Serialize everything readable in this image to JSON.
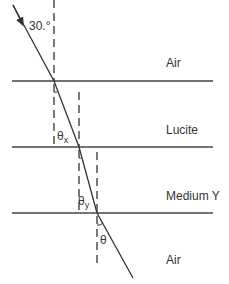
{
  "diagram": {
    "type": "refraction-layers",
    "incident_angle_label": "30.°",
    "layers": [
      {
        "name": "Air"
      },
      {
        "name": "Lucite"
      },
      {
        "name": "Medium Y"
      },
      {
        "name": "Air"
      }
    ],
    "angles": {
      "theta_x": {
        "symbol": "θ",
        "subscript": "x"
      },
      "theta_y": {
        "symbol": "θ",
        "subscript": "y"
      },
      "theta": {
        "symbol": "θ"
      }
    },
    "colors": {
      "line": "#333333",
      "background": "#ffffff"
    }
  }
}
